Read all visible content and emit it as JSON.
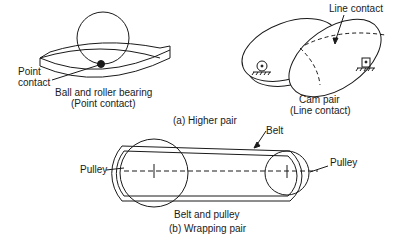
{
  "figure": {
    "higher_pair": {
      "caption": "(a) Higher pair",
      "bearing": {
        "point_label_line1": "Point",
        "point_label_line2": "contact",
        "title_line1": "Ball and roller bearing",
        "title_line2": "(Point contact)"
      },
      "cam": {
        "line_contact_label": "Line contact",
        "title_line1": "Cam pair",
        "title_line2": "(Line contact)"
      }
    },
    "wrapping_pair": {
      "caption": "(b) Wrapping pair",
      "title": "Belt and pulley",
      "belt_label": "Belt",
      "left_pulley_label": "Pulley",
      "right_pulley_label": "Pulley"
    }
  },
  "colors": {
    "ink": "#1a1a1a",
    "background": "#ffffff"
  }
}
